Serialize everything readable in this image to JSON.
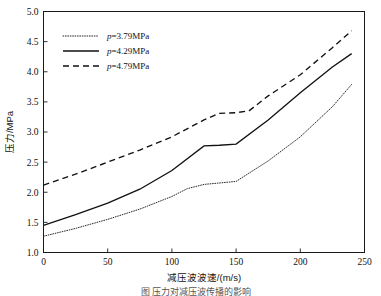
{
  "figure": {
    "caption": "图   压力对减压波传播的影响",
    "ylabel": "压力/MPa",
    "xlabel": "减压波波速/(m/s)"
  },
  "axes": {
    "y_ticks": [
      "1.0",
      "1.5",
      "2.0",
      "2.5",
      "3.0",
      "3.5",
      "4.0",
      "4.5",
      "5.0"
    ],
    "x_ticks": [
      "0",
      "50",
      "100",
      "150",
      "200",
      "250"
    ]
  },
  "legend": {
    "items": [
      {
        "symbol": "p",
        "text": "=3.79MPa",
        "style": "dotted"
      },
      {
        "symbol": "p",
        "text": "=4.29MPa",
        "style": "solid"
      },
      {
        "symbol": "p",
        "text": "=4.79MPa",
        "style": "dashed"
      }
    ]
  },
  "chart_data": {
    "type": "line",
    "title": "",
    "xlabel": "减压波波速/(m/s)",
    "ylabel": "压力/MPa",
    "xlim": [
      0,
      250
    ],
    "ylim": [
      1.0,
      5.0
    ],
    "xticks": [
      0,
      50,
      100,
      150,
      200,
      250
    ],
    "yticks": [
      1.0,
      1.5,
      2.0,
      2.5,
      3.0,
      3.5,
      4.0,
      4.5,
      5.0
    ],
    "grid": false,
    "legend_position": "upper left (inside axes)",
    "series": [
      {
        "name": "p=3.79MPa",
        "style": "dotted",
        "color": "#111111",
        "x": [
          0,
          25,
          50,
          75,
          100,
          112,
          125,
          150,
          175,
          200,
          225,
          240
        ],
        "y": [
          1.27,
          1.4,
          1.55,
          1.72,
          1.93,
          2.06,
          2.13,
          2.18,
          2.52,
          2.92,
          3.42,
          3.79
        ]
      },
      {
        "name": "p=4.29MPa",
        "style": "solid",
        "color": "#111111",
        "x": [
          0,
          25,
          50,
          75,
          100,
          125,
          137,
          150,
          175,
          200,
          225,
          240
        ],
        "y": [
          1.45,
          1.63,
          1.82,
          2.05,
          2.36,
          2.77,
          2.78,
          2.8,
          3.2,
          3.65,
          4.08,
          4.3
        ]
      },
      {
        "name": "p=4.79MPa",
        "style": "dashed",
        "color": "#111111",
        "x": [
          0,
          25,
          50,
          75,
          100,
          125,
          137,
          150,
          160,
          175,
          200,
          225,
          240
        ],
        "y": [
          2.12,
          2.3,
          2.5,
          2.7,
          2.92,
          3.2,
          3.31,
          3.32,
          3.35,
          3.6,
          3.95,
          4.4,
          4.68
        ]
      }
    ]
  }
}
